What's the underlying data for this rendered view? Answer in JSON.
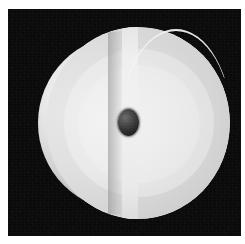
{
  "figure": {
    "description": "Grayscale three-dimensional rendering of a sphere with a wedge-shaped section removed, revealing concentric interior shells and a small dark central core.",
    "background_color": "#0a0a0a",
    "frame_color": "#ffffff",
    "canvas": {
      "x": 8,
      "y": 9,
      "width": 233,
      "height": 227
    }
  },
  "render": {
    "object_name": "cutaway-sphere",
    "projection": "perspective",
    "shading": "smooth-diffuse",
    "light_direction": "upper-left",
    "cut_type": "meridional-wedge",
    "cut_plane_label": "slice-plane"
  },
  "layers": [
    {
      "id": "outer-sphere",
      "label": "Outer surface",
      "color": "#d2d2d2",
      "highlight_color": "#fbfbfb",
      "shadow_color": "#747474"
    },
    {
      "id": "shell-crust",
      "label": "Outer shell",
      "color": "#d4d4d4",
      "highlight_color": "#e8e8e8",
      "shadow_color": "#a8a8a8"
    },
    {
      "id": "shell-mantle",
      "label": "Middle shell",
      "color": "#e1e1e1",
      "highlight_color": "#f0f0f0",
      "shadow_color": "#cacaca"
    },
    {
      "id": "shell-inner",
      "label": "Inner shell",
      "color": "#e6e6e6",
      "highlight_color": "#f3f3f3",
      "shadow_color": "#d2d2d2"
    },
    {
      "id": "core",
      "label": "Core",
      "color": "#2e2e2e",
      "highlight_color": "#6b6b6b",
      "shadow_color": "#161616"
    }
  ],
  "cut_face": {
    "label": "Cut plane face",
    "color": "#f1f1f1",
    "rim_color": "#ffffff"
  }
}
